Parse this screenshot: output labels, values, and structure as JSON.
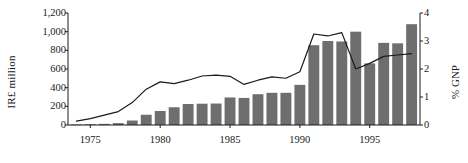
{
  "chart_data": {
    "type": "bar",
    "title": "",
    "subtitle": "",
    "xlabel": "",
    "ylabel": "IR£ million",
    "ylabel_secondary": "% GNP",
    "xlim": [
      1973.4,
      1998.6
    ],
    "ylim": [
      0,
      1200
    ],
    "ylim_secondary": [
      0,
      4
    ],
    "grid": false,
    "legend": null,
    "y_ticks": [
      "0",
      "200",
      "400",
      "600",
      "800",
      "1,000",
      "1,200"
    ],
    "y_tick_values": [
      0,
      200,
      400,
      600,
      800,
      1000,
      1200
    ],
    "y2_ticks": [
      "0",
      "1",
      "2",
      "3",
      "4"
    ],
    "y2_tick_values": [
      0,
      1,
      2,
      3,
      4
    ],
    "x_ticks": [
      "1975",
      "1980",
      "1985",
      "1990",
      "1995"
    ],
    "x_tick_values": [
      1975,
      1980,
      1985,
      1990,
      1995
    ],
    "categories": [
      1974,
      1975,
      1976,
      1977,
      1978,
      1979,
      1980,
      1981,
      1982,
      1983,
      1984,
      1985,
      1986,
      1987,
      1988,
      1989,
      1990,
      1991,
      1992,
      1993,
      1994,
      1995,
      1996,
      1997,
      1998
    ],
    "series": [
      {
        "name": "IR£ million",
        "axis": "left",
        "render": "bar",
        "values": [
          5,
          8,
          12,
          20,
          48,
          110,
          150,
          190,
          225,
          228,
          230,
          295,
          290,
          330,
          345,
          345,
          430,
          855,
          900,
          895,
          1000,
          660,
          880,
          875,
          1080
        ]
      },
      {
        "name": "% GNP",
        "axis": "right",
        "render": "line",
        "values": [
          0.14,
          0.23,
          0.35,
          0.48,
          0.8,
          1.28,
          1.54,
          1.48,
          1.6,
          1.75,
          1.78,
          1.74,
          1.45,
          1.6,
          1.72,
          1.67,
          1.9,
          3.25,
          3.18,
          3.3,
          2.0,
          2.2,
          2.45,
          2.5,
          2.55
        ]
      }
    ]
  },
  "axes": {
    "left_label": "IR£ million",
    "right_label": "% GNP"
  }
}
